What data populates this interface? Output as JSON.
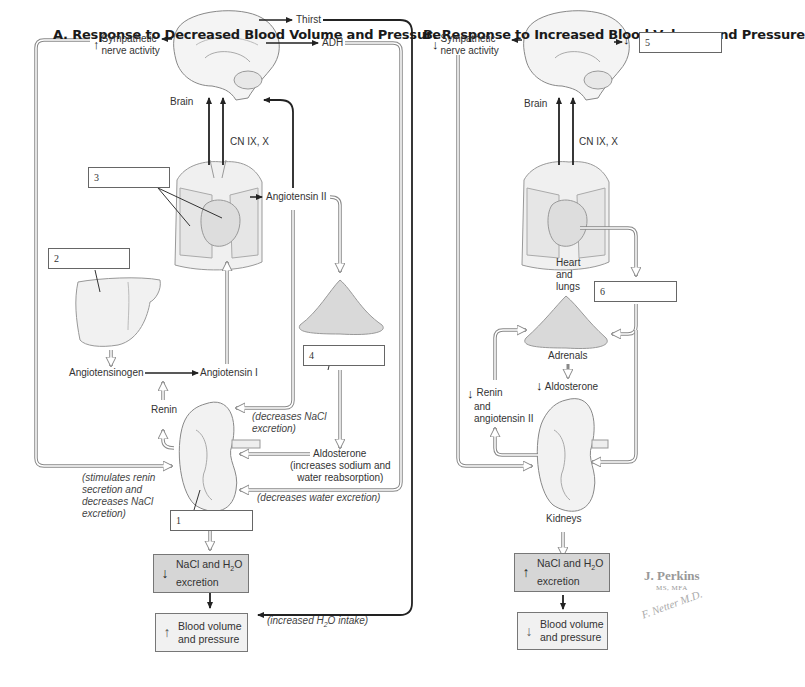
{
  "panelA": {
    "title": "A. Response to Decreased Blood Volume and Pressure",
    "labels": {
      "sympathetic_arrow": "↑",
      "sympathetic": "Sympathetic",
      "sympathetic2": "nerve activity",
      "thirst": "Thirst",
      "adh": "ADH",
      "brain": "Brain",
      "cn": "CN IX, X",
      "angiotensin2": "Angiotensin II",
      "angiotensinogen": "Angiotensinogen",
      "angiotensin1": "Angiotensin I",
      "renin": "Renin",
      "decreases_nacl_1": "(decreases NaCl",
      "decreases_nacl_2": "excretion)",
      "aldosterone": "Aldosterone",
      "aldosterone_note1": "(increases sodium and",
      "aldosterone_note2": "water reabsorption)",
      "decreases_water": "(decreases water excretion)",
      "stimulates1": "(stimulates renin",
      "stimulates2": "secretion and",
      "stimulates3": "decreases NaCl",
      "stimulates4": "excretion)",
      "increased_intake_pre": "(increased H",
      "increased_intake_sub": "2",
      "increased_intake_post": "O intake)"
    },
    "boxes": {
      "b1": "1",
      "b2": "2",
      "b3": "3",
      "b4": "4"
    },
    "result1": {
      "arrow": "↓",
      "line1": "NaCl and H",
      "sub": "2",
      "line1b": "O",
      "line2": "excretion"
    },
    "result2": {
      "arrow": "↑",
      "line1": "Blood volume",
      "line2": "and pressure"
    }
  },
  "panelB": {
    "title": "B. Response to Increased Blood Volume and Pressure",
    "labels": {
      "sympathetic_arrow": "↓",
      "sympathetic": "Sympathetic",
      "sympathetic2": "nerve activity",
      "brain": "Brain",
      "cn": "CN IX, X",
      "box5_arrow": "↓",
      "heart1": "Heart",
      "heart2": "and",
      "heart3": "lungs",
      "adrenals": "Adrenals",
      "aldosterone_arrow": "↓",
      "aldosterone": "Aldosterone",
      "renin_arrow": "↓",
      "renin1": "Renin",
      "renin2": "and",
      "renin3": "angiotensin II",
      "kidneys": "Kidneys"
    },
    "boxes": {
      "b5": "5",
      "b6": "6"
    },
    "result1": {
      "arrow": "↑",
      "line1": "NaCl and H",
      "sub": "2",
      "line1b": "O",
      "line2": "excretion"
    },
    "result2": {
      "arrow": "↓",
      "line1": "Blood volume",
      "line2": "and pressure"
    }
  },
  "signature": {
    "name": "J. Perkins",
    "degree": "MS, MFA",
    "netter": "F. Netter M.D."
  },
  "colors": {
    "adrenal": "#d9d9d9",
    "gray_box": "#d6d6d6",
    "light_box": "#f1f1f1",
    "line": "#222222",
    "hollow": "#8a8a8a"
  }
}
